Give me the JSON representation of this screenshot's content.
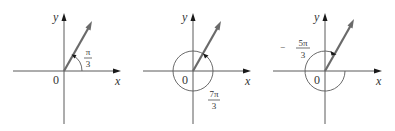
{
  "figure": {
    "panels": [
      {
        "id": "panel-1",
        "axis_x_label": "x",
        "axis_y_label": "y",
        "origin_label": "0",
        "angle_label": {
          "sign": "",
          "numerator": "π",
          "denominator": "3"
        },
        "angle_value": "π/3",
        "arc_type": "counterclockwise-small"
      },
      {
        "id": "panel-2",
        "axis_x_label": "x",
        "axis_y_label": "y",
        "origin_label": "0",
        "angle_label": {
          "sign": "",
          "numerator": "7π",
          "denominator": "3"
        },
        "angle_value": "7π/3",
        "arc_type": "counterclockwise-full-plus"
      },
      {
        "id": "panel-3",
        "axis_x_label": "x",
        "axis_y_label": "y",
        "origin_label": "0",
        "angle_label": {
          "sign": "−",
          "numerator": "5π",
          "denominator": "3"
        },
        "angle_value": "−5π/3",
        "arc_type": "clockwise"
      }
    ]
  },
  "colors": {
    "axis": "#5a5a5a",
    "vector": "#6a6a6a",
    "text": "#333333",
    "background": "#ffffff"
  }
}
